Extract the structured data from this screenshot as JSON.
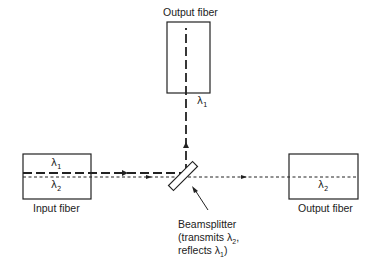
{
  "diagram": {
    "labels": {
      "output_fiber_top": "Output fiber",
      "input_fiber": "Input fiber",
      "output_fiber_right": "Output fiber",
      "beamsplitter_line1": "Beamsplitter",
      "beamsplitter_line2": "(transmits λ2,",
      "beamsplitter_line3": "reflects λ1)"
    },
    "wavelengths": {
      "lambda1_symbol": "λ",
      "lambda1_sub": "1",
      "lambda2_symbol": "λ",
      "lambda2_sub": "2"
    },
    "components": [
      "Input fiber",
      "Beamsplitter",
      "Output fiber (reflected λ1)",
      "Output fiber (transmitted λ2)"
    ],
    "beams": [
      {
        "name": "λ1",
        "style": "long-dash",
        "path": "input fiber → beamsplitter → up to top output fiber"
      },
      {
        "name": "λ2",
        "style": "short-dot",
        "path": "input fiber → beamsplitter → right output fiber"
      }
    ]
  }
}
